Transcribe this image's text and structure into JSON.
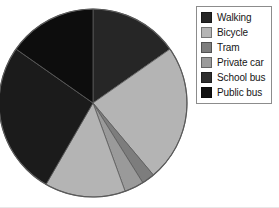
{
  "chart_data": {
    "type": "pie",
    "title": "",
    "categories": [
      "Walking",
      "Bicycle",
      "Tram",
      "Private car",
      "School bus",
      "Public bus"
    ],
    "values": [
      15.3,
      23.6,
      2.2,
      3.3,
      13.9,
      41.7
    ],
    "colors": [
      "#262626",
      "#b4b4b4",
      "#7d7d7d",
      "#9a9a9a",
      "#2e2e2e",
      "#111111"
    ],
    "start_angle_deg": 0,
    "direction": "clockwise",
    "legend_position": "right",
    "grid": false,
    "xlabel": "",
    "ylabel": ""
  },
  "legend": {
    "items": [
      {
        "label": "Walking",
        "color": "#262626"
      },
      {
        "label": "Bicycle",
        "color": "#b4b4b4"
      },
      {
        "label": "Tram",
        "color": "#7d7d7d"
      },
      {
        "label": "Private car",
        "color": "#9a9a9a"
      },
      {
        "label": "School bus",
        "color": "#2e2e2e"
      },
      {
        "label": "Public bus",
        "color": "#111111"
      }
    ],
    "border_color": "#8c8c8c",
    "background_color": "#ffffff"
  },
  "pie": {
    "center_x": 93,
    "center_y": 103,
    "radius": 94,
    "outline_color": "#5a5a5a",
    "slices": [
      {
        "name": "Walking",
        "start_deg": 0.0,
        "end_deg": 55.0,
        "color": "#262626"
      },
      {
        "name": "Bicycle",
        "start_deg": 55.0,
        "end_deg": 140.0,
        "color": "#b4b4b4"
      },
      {
        "name": "Tram",
        "start_deg": 140.0,
        "end_deg": 148.0,
        "color": "#7d7d7d"
      },
      {
        "name": "Private car",
        "start_deg": 148.0,
        "end_deg": 160.0,
        "color": "#9a9a9a"
      },
      {
        "name": "School bus",
        "start_deg": 160.0,
        "end_deg": 210.0,
        "color": "#b4b4b4"
      },
      {
        "name": "Public bus",
        "start_deg": 210.0,
        "end_deg": 305.0,
        "color": "#1b1b1b"
      },
      {
        "name": "Walking-b",
        "start_deg": 305.0,
        "end_deg": 360.0,
        "color": "#0d0d0d"
      }
    ]
  }
}
